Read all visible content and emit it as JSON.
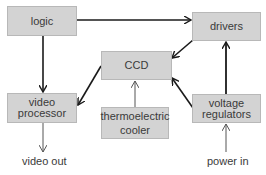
{
  "diagram": {
    "blocks": {
      "logic": "logic",
      "drivers": "drivers",
      "ccd": "CCD",
      "video_processor_line1": "video",
      "video_processor_line2": "processor",
      "thermoelectric_cooler_line1": "thermoelectric",
      "thermoelectric_cooler_line2": "cooler",
      "voltage_regulators_line1": "voltage",
      "voltage_regulators_line2": "regulators"
    },
    "io_labels": {
      "video_out": "video out",
      "power_in": "power in"
    },
    "connections": [
      {
        "from": "logic",
        "to": "drivers"
      },
      {
        "from": "logic",
        "to": "video processor"
      },
      {
        "from": "drivers",
        "to": "CCD"
      },
      {
        "from": "CCD",
        "to": "video processor"
      },
      {
        "from": "thermoelectric cooler",
        "to": "CCD"
      },
      {
        "from": "voltage regulators",
        "to": "CCD"
      },
      {
        "from": "voltage regulators",
        "to": "drivers"
      },
      {
        "from": "video processor",
        "to": "video out"
      },
      {
        "from": "power in",
        "to": "voltage regulators"
      }
    ],
    "colors": {
      "box_fill": "#d3d3d3",
      "box_border": "#b8b8b8",
      "arrow": "#1a1a1a",
      "text": "#3a3a3a"
    }
  }
}
